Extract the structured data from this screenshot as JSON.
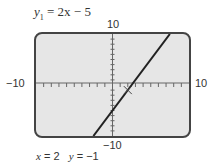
{
  "equation": {
    "var": "y",
    "sub": "1",
    "rhs": " = 2x − 5"
  },
  "window": {
    "xmin": "−10",
    "xmax": "10",
    "ymin": "−10",
    "ymax": "10"
  },
  "trace": {
    "x_label": "x",
    "x_value": "= 2",
    "y_label": "y",
    "y_value": "= −1"
  },
  "chart_data": {
    "type": "line",
    "title": "y1 = 2x − 5",
    "xlabel": "x",
    "ylabel": "y",
    "xlim": [
      -10,
      10
    ],
    "ylim": [
      -10,
      10
    ],
    "grid": false,
    "axis_ticks": {
      "x_step": 1,
      "y_step": 1
    },
    "series": [
      {
        "name": "y1 = 2x − 5",
        "x": [
          -2.5,
          7.5
        ],
        "y": [
          -10,
          10
        ],
        "slope": 2,
        "intercept": -5
      }
    ],
    "annotations": [
      {
        "type": "trace-cursor",
        "x": 2,
        "y": -1,
        "text": "x = 2  y = −1"
      }
    ]
  }
}
